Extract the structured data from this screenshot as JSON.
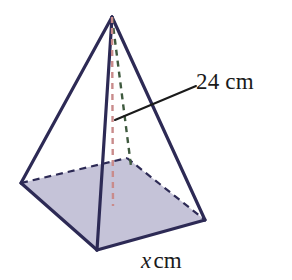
{
  "figure": {
    "kind": "square-pyramid-diagram",
    "canvas": {
      "width": 292,
      "height": 280,
      "background": "#ffffff"
    },
    "colors": {
      "edge": "#2d2a55",
      "base_fill": "#c5c3d8",
      "height_dash": "#c98b8b",
      "slant_dash": "#3f5a3f",
      "leader": "#1a1a1a",
      "text": "#1a1a1a"
    },
    "geometry": {
      "apex": {
        "x": 112,
        "y": 17
      },
      "base_left": {
        "x": 21,
        "y": 183
      },
      "base_back": {
        "x": 127,
        "y": 158
      },
      "base_right": {
        "x": 205,
        "y": 220
      },
      "base_front": {
        "x": 97,
        "y": 250
      },
      "base_center": {
        "x": 113,
        "y": 202
      },
      "leader_start": {
        "x": 115,
        "y": 120
      },
      "leader_end": {
        "x": 196,
        "y": 86
      }
    }
  },
  "labels": {
    "height": {
      "value": "24",
      "unit": "cm",
      "full": "24 cm"
    },
    "base_edge": {
      "variable": "x",
      "unit": "cm",
      "full": "x cm"
    }
  }
}
